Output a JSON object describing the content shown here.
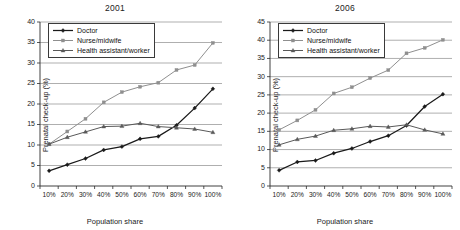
{
  "figure": {
    "xlabel": "Population share",
    "ylabel": "Prenatal check-up (%)",
    "legend_labels": {
      "doctor": "Doctor",
      "nurse": "Nurse/midwife",
      "health": "Health assistant/worker"
    },
    "colors": {
      "doctor": "#1a1a1a",
      "nurse": "#8f8f8f",
      "health": "#595959",
      "grid": "#8c8c8c",
      "axis": "#2b2b2b",
      "background": "#ffffff"
    },
    "markers": {
      "doctor": "diamond",
      "nurse": "square",
      "health": "triangle"
    }
  },
  "chart_data": [
    {
      "type": "line",
      "title": "2001",
      "xlabel": "Population share",
      "ylabel": "Prenatal check-up (%)",
      "categories": [
        "10%",
        "20%",
        "30%",
        "40%",
        "50%",
        "60%",
        "70%",
        "80%",
        "90%",
        "100%"
      ],
      "ylim": [
        0,
        40
      ],
      "yticks": [
        0,
        5,
        10,
        15,
        20,
        25,
        30,
        35,
        40
      ],
      "grid": true,
      "legend_position": "top-left-inside",
      "series": [
        {
          "name": "Doctor",
          "values": [
            3.7,
            5.2,
            6.7,
            8.8,
            9.6,
            11.5,
            12.1,
            14.8,
            19.0,
            23.7
          ]
        },
        {
          "name": "Nurse/midwife",
          "values": [
            10.2,
            13.3,
            16.4,
            20.4,
            22.9,
            24.2,
            25.2,
            28.3,
            29.5,
            34.9
          ]
        },
        {
          "name": "Health assistant/worker",
          "values": [
            10.2,
            11.9,
            13.2,
            14.5,
            14.6,
            15.3,
            14.5,
            14.2,
            13.9,
            13.1
          ]
        }
      ]
    },
    {
      "type": "line",
      "title": "2006",
      "xlabel": "Population share",
      "ylabel": "Prenatal check-up (%)",
      "categories": [
        "10%",
        "20%",
        "30%",
        "40%",
        "50%",
        "60%",
        "70%",
        "80%",
        "90%",
        "100%"
      ],
      "ylim": [
        0,
        45
      ],
      "yticks": [
        0,
        5,
        10,
        15,
        20,
        25,
        30,
        35,
        40,
        45
      ],
      "grid": true,
      "legend_position": "top-left-inside",
      "series": [
        {
          "name": "Doctor",
          "values": [
            4.3,
            6.6,
            7.0,
            9.0,
            10.3,
            12.2,
            13.8,
            16.6,
            21.8,
            25.2
          ]
        },
        {
          "name": "Nurse/midwife",
          "values": [
            15.4,
            18.0,
            20.9,
            25.4,
            27.1,
            29.6,
            31.8,
            36.4,
            37.9,
            40.1
          ]
        },
        {
          "name": "Health assistant/worker",
          "values": [
            11.3,
            12.8,
            13.7,
            15.3,
            15.7,
            16.4,
            16.2,
            16.8,
            15.4,
            14.3
          ]
        }
      ]
    }
  ]
}
